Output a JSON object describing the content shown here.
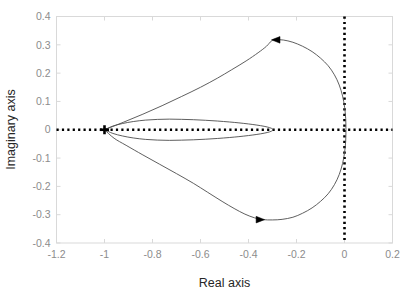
{
  "chart_data": {
    "type": "line",
    "title": "",
    "subtitle": "",
    "xlabel": "Real axis",
    "ylabel": "Imaginary axis",
    "xlim": [
      -1.2,
      0.2
    ],
    "ylim": [
      -0.4,
      0.4
    ],
    "xticks": [
      -1.2,
      -1,
      -0.8,
      -0.6,
      -0.4,
      -0.2,
      0,
      0.2
    ],
    "xticklabels": [
      "-1.2",
      "-1",
      "-0.8",
      "-0.6",
      "-0.4",
      "-0.2",
      "0",
      "0.2"
    ],
    "yticks": [
      -0.4,
      -0.3,
      -0.2,
      -0.1,
      0,
      0.1,
      0.2,
      0.3,
      0.4
    ],
    "yticklabels": [
      "-0.4",
      "-0.3",
      "-0.2",
      "-0.1",
      "0",
      "0.1",
      "0.2",
      "0.3",
      "0.4"
    ],
    "grid": false,
    "legend": null,
    "legend_position": "none",
    "box": true,
    "series": [
      {
        "name": "nyquist-outer-loop",
        "color": "#4d4d4d",
        "linewidth": 0.9,
        "closed": true,
        "points": [
          [
            -1.0,
            0.0
          ],
          [
            -0.92,
            0.027
          ],
          [
            -0.84,
            0.055
          ],
          [
            -0.76,
            0.085
          ],
          [
            -0.68,
            0.117
          ],
          [
            -0.6,
            0.15
          ],
          [
            -0.53,
            0.182
          ],
          [
            -0.47,
            0.212
          ],
          [
            -0.41,
            0.243
          ],
          [
            -0.36,
            0.272
          ],
          [
            -0.325,
            0.295
          ],
          [
            -0.305,
            0.313
          ],
          [
            -0.285,
            0.3175
          ],
          [
            -0.255,
            0.317
          ],
          [
            -0.215,
            0.309
          ],
          [
            -0.175,
            0.295
          ],
          [
            -0.135,
            0.276
          ],
          [
            -0.1,
            0.253
          ],
          [
            -0.068,
            0.226
          ],
          [
            -0.042,
            0.194
          ],
          [
            -0.022,
            0.158
          ],
          [
            -0.008,
            0.119
          ],
          [
            0.0005,
            0.079
          ],
          [
            0.005,
            0.04
          ],
          [
            0.006,
            0.0
          ],
          [
            0.005,
            -0.04
          ],
          [
            0.0005,
            -0.079
          ],
          [
            -0.008,
            -0.119
          ],
          [
            -0.022,
            -0.158
          ],
          [
            -0.042,
            -0.194
          ],
          [
            -0.068,
            -0.226
          ],
          [
            -0.1,
            -0.253
          ],
          [
            -0.135,
            -0.276
          ],
          [
            -0.175,
            -0.295
          ],
          [
            -0.215,
            -0.309
          ],
          [
            -0.26,
            -0.3165
          ],
          [
            -0.3,
            -0.3185
          ],
          [
            -0.34,
            -0.3175
          ],
          [
            -0.375,
            -0.311
          ],
          [
            -0.415,
            -0.298
          ],
          [
            -0.46,
            -0.278
          ],
          [
            -0.51,
            -0.253
          ],
          [
            -0.57,
            -0.221
          ],
          [
            -0.63,
            -0.189
          ],
          [
            -0.7,
            -0.155
          ],
          [
            -0.77,
            -0.122
          ],
          [
            -0.84,
            -0.089
          ],
          [
            -0.91,
            -0.055
          ],
          [
            -0.96,
            -0.03
          ],
          [
            -1.0,
            0.0
          ]
        ]
      },
      {
        "name": "nyquist-inner-loop",
        "color": "#4d4d4d",
        "linewidth": 0.9,
        "closed": true,
        "points": [
          [
            -1.0,
            0.0
          ],
          [
            -0.965,
            0.013
          ],
          [
            -0.925,
            0.022
          ],
          [
            -0.88,
            0.029
          ],
          [
            -0.83,
            0.034
          ],
          [
            -0.78,
            0.0365
          ],
          [
            -0.73,
            0.0375
          ],
          [
            -0.68,
            0.0368
          ],
          [
            -0.63,
            0.0355
          ],
          [
            -0.58,
            0.0335
          ],
          [
            -0.53,
            0.0308
          ],
          [
            -0.48,
            0.0275
          ],
          [
            -0.44,
            0.0243
          ],
          [
            -0.4,
            0.0205
          ],
          [
            -0.365,
            0.0165
          ],
          [
            -0.335,
            0.0122
          ],
          [
            -0.312,
            0.0075
          ],
          [
            -0.3,
            0.003
          ],
          [
            -0.299,
            0.0
          ],
          [
            -0.3,
            -0.003
          ],
          [
            -0.312,
            -0.0075
          ],
          [
            -0.335,
            -0.0122
          ],
          [
            -0.365,
            -0.0165
          ],
          [
            -0.4,
            -0.0205
          ],
          [
            -0.44,
            -0.0243
          ],
          [
            -0.48,
            -0.0275
          ],
          [
            -0.53,
            -0.0308
          ],
          [
            -0.58,
            -0.0335
          ],
          [
            -0.63,
            -0.0355
          ],
          [
            -0.68,
            -0.0368
          ],
          [
            -0.73,
            -0.0375
          ],
          [
            -0.78,
            -0.0365
          ],
          [
            -0.83,
            -0.034
          ],
          [
            -0.88,
            -0.029
          ],
          [
            -0.925,
            -0.022
          ],
          [
            -0.965,
            -0.013
          ],
          [
            -1.0,
            0.0
          ]
        ]
      }
    ],
    "markers": [
      {
        "name": "critical-point-marker",
        "shape": "plus",
        "x": -1.0,
        "y": 0.0,
        "color": "#000000",
        "size": 9
      }
    ],
    "arrows": [
      {
        "name": "direction-arrow-upper",
        "x": -0.285,
        "y": 0.3175,
        "direction": "left",
        "color": "#000000"
      },
      {
        "name": "direction-arrow-lower",
        "x": -0.352,
        "y": -0.3175,
        "direction": "right",
        "color": "#000000"
      }
    ],
    "reference_lines": [
      {
        "name": "zero-imaginary-dotted-line",
        "orientation": "horizontal",
        "value": 0.0,
        "style": "dotted",
        "color": "#000000"
      },
      {
        "name": "zero-real-dotted-line",
        "orientation": "vertical",
        "value": 0.0,
        "style": "dotted",
        "color": "#000000"
      }
    ],
    "colors": {
      "curve": "#4d4d4d",
      "axis": "#d9d9d9",
      "ticklabel": "#8c8c8c",
      "axistitle": "#262626",
      "reference": "#000000",
      "background": "#ffffff"
    }
  }
}
